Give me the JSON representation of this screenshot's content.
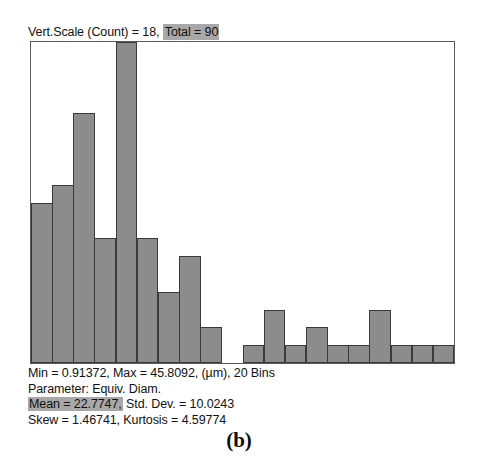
{
  "header": {
    "vert_scale_label": "Vert.Scale (Count) = 18,",
    "total_label": "Total = 90"
  },
  "stats": {
    "line1": "Min = 0.91372, Max = 45.8092, (µm), 20 Bins",
    "line2": "Parameter: Equiv. Diam.",
    "line3_highlight": "Mean = 22.7747,",
    "line3_rest": " Std. Dev. = 10.0243",
    "line4": "Skew = 1.46741, Kurtosis = 4.59774"
  },
  "caption": {
    "label": "(b)"
  },
  "colors": {
    "bar_fill": "#8c8c8c",
    "bar_stroke": "#3a3a3a",
    "frame": "#5a5a5a",
    "highlight": "#a8a8a8",
    "background": "#ffffff"
  },
  "chart_data": {
    "type": "bar",
    "xlabel": "Equiv. Diam. (µm)",
    "ylabel": "Count",
    "ylim": [
      0,
      18
    ],
    "xlim": [
      0.91372,
      45.8092
    ],
    "grid": false,
    "legend": null,
    "bins": 20,
    "total": 90,
    "vert_scale": 18,
    "min": 0.91372,
    "max": 45.8092,
    "units": "µm",
    "parameter": "Equiv. Diam.",
    "mean": 22.7747,
    "std_dev": 10.0243,
    "skew": 1.46741,
    "kurtosis": 4.59774,
    "categories": [
      "0.91-3.16",
      "3.16-5.40",
      "5.40-7.65",
      "7.65-9.89",
      "9.89-12.14",
      "12.14-14.39",
      "14.39-16.63",
      "16.63-18.88",
      "18.88-21.12",
      "21.12-23.37",
      "23.37-25.61",
      "25.61-27.86",
      "27.86-30.11",
      "30.11-32.35",
      "32.35-34.60",
      "34.60-36.84",
      "36.84-39.09",
      "39.09-41.33",
      "41.33-43.58",
      "43.58-45.81"
    ],
    "values": [
      9,
      10,
      14,
      7,
      18,
      7,
      4,
      6,
      2,
      0,
      1,
      3,
      1,
      2,
      1,
      1,
      3,
      1,
      1,
      1
    ]
  }
}
